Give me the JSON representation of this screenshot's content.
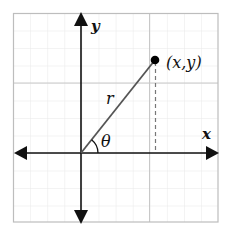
{
  "diagram": {
    "type": "polar-coordinates",
    "labels": {
      "x_axis": "x",
      "y_axis": "y",
      "radius": "r",
      "angle": "θ",
      "point": "(x,y)"
    },
    "colors": {
      "background": "#ffffff",
      "grid_minor": "#e8e8e8",
      "grid_major": "#c8c8c8",
      "border": "#bdbdbd",
      "axis": "#111111",
      "radius_line": "#555555",
      "dashed_line": "#777777",
      "point": "#000000"
    }
  }
}
